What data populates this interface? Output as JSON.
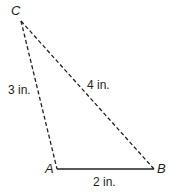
{
  "diagram": {
    "vertices": {
      "A": {
        "label": "A",
        "x": 57,
        "y": 169
      },
      "B": {
        "label": "B",
        "x": 154,
        "y": 169
      },
      "C": {
        "label": "C",
        "x": 21,
        "y": 21
      }
    },
    "sides": [
      {
        "from": "C",
        "to": "A",
        "label": "3 in.",
        "style": "dashed"
      },
      {
        "from": "C",
        "to": "B",
        "label": "4 in.",
        "style": "dashed"
      },
      {
        "from": "A",
        "to": "B",
        "label": "2 in.",
        "style": "solid"
      }
    ],
    "line_color": "#231f20"
  }
}
